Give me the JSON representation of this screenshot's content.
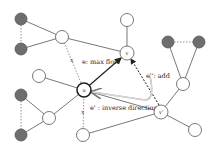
{
  "colors": {
    "edge": "#555555",
    "dotted": "#777777",
    "gray_node": "#6e6e6e",
    "node_stroke": "#555555",
    "arrow": "#222222",
    "inverse_arrow": "#999999"
  },
  "labels": {
    "max_flow": "e: max flow",
    "add": "e'': add",
    "inverse": "e' : inverse direction",
    "node_u": "u",
    "node_v": "v",
    "node_vp": "v'",
    "cut_mark": "x"
  },
  "nodes": [
    {
      "id": "g1",
      "x": 21,
      "y": 19,
      "type": "gray"
    },
    {
      "id": "g2",
      "x": 21,
      "y": 49,
      "type": "gray"
    },
    {
      "id": "a",
      "x": 62,
      "y": 37,
      "type": "white"
    },
    {
      "id": "top",
      "x": 127,
      "y": 20,
      "type": "white"
    },
    {
      "id": "v",
      "x": 127,
      "y": 53,
      "type": "key",
      "label": "v"
    },
    {
      "id": "g3",
      "x": 168,
      "y": 42,
      "type": "gray"
    },
    {
      "id": "g4",
      "x": 199,
      "y": 42,
      "type": "gray"
    },
    {
      "id": "rm",
      "x": 183,
      "y": 84,
      "type": "white"
    },
    {
      "id": "vp",
      "x": 161,
      "y": 112,
      "type": "key",
      "label": "v'"
    },
    {
      "id": "fr",
      "x": 195,
      "y": 130,
      "type": "white"
    },
    {
      "id": "u",
      "x": 84,
      "y": 90,
      "type": "key-bold",
      "label": "u"
    },
    {
      "id": "lm",
      "x": 39,
      "y": 76,
      "type": "white"
    },
    {
      "id": "g5",
      "x": 21,
      "y": 95,
      "type": "gray"
    },
    {
      "id": "g6",
      "x": 21,
      "y": 135,
      "type": "gray"
    },
    {
      "id": "ll",
      "x": 49,
      "y": 118,
      "type": "white"
    },
    {
      "id": "bu",
      "x": 83,
      "y": 135,
      "type": "white"
    }
  ]
}
